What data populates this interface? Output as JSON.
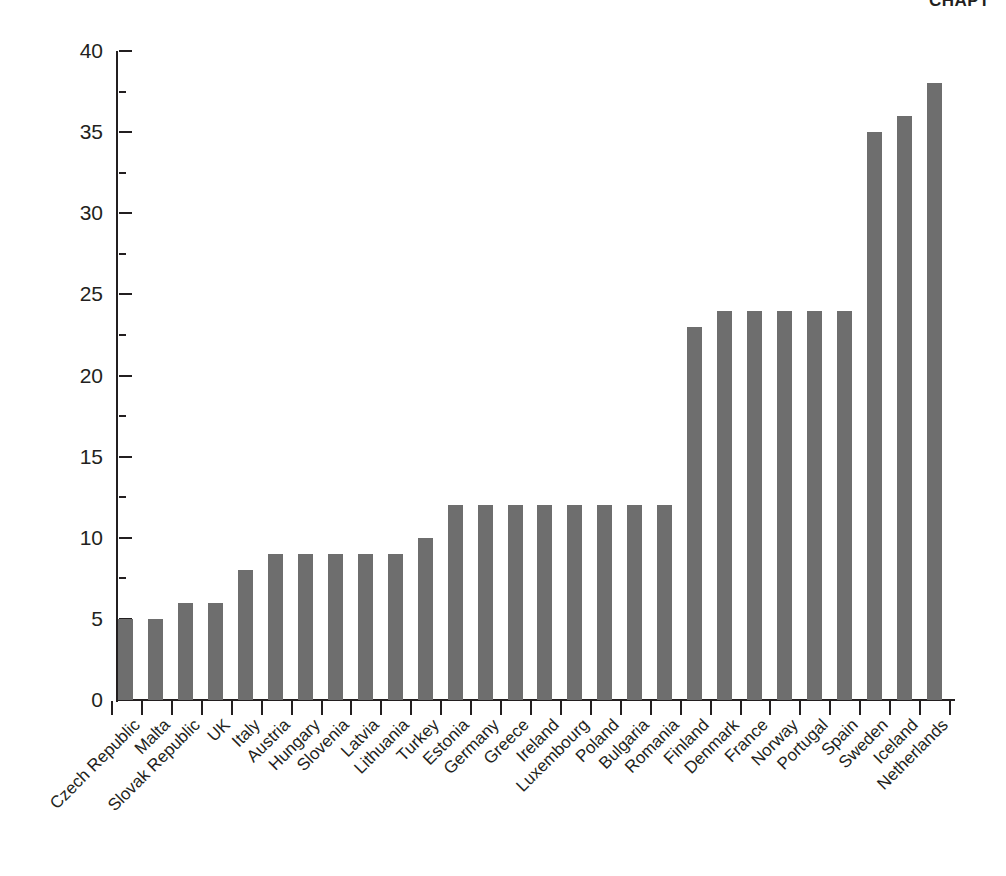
{
  "header": {
    "running_title": "CHAPT"
  },
  "chart_data": {
    "type": "bar",
    "title": "",
    "subtitle": "",
    "xlabel": "",
    "ylabel": "",
    "ylim": [
      0,
      40
    ],
    "ytick_step": 5,
    "yticks": [
      0,
      5,
      10,
      15,
      20,
      25,
      30,
      35,
      40
    ],
    "grid": false,
    "legend": null,
    "orientation": "vertical",
    "bar_color": "#6e6e6e",
    "axis_color": "#231f20",
    "categories": [
      "Czech Republic",
      "Malta",
      "Slovak Republic",
      "UK",
      "Italy",
      "Austria",
      "Hungary",
      "Slovenia",
      "Latvia",
      "Lithuania",
      "Turkey",
      "Estonia",
      "Germany",
      "Greece",
      "Ireland",
      "Luxembourg",
      "Poland",
      "Bulgaria",
      "Romania",
      "Finland",
      "Denmark",
      "France",
      "Norway",
      "Portugal",
      "Spain",
      "Sweden",
      "Iceland",
      "Netherlands"
    ],
    "values": [
      5,
      5,
      6,
      6,
      8,
      9,
      9,
      9,
      9,
      9,
      10,
      12,
      12,
      12,
      12,
      12,
      12,
      12,
      12,
      23,
      24,
      24,
      24,
      24,
      24,
      35,
      36,
      38
    ]
  }
}
